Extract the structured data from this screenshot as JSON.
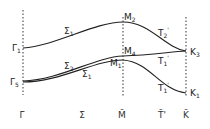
{
  "diagram": {
    "type": "band-structure",
    "axis_points": [
      {
        "label": "Γ̄",
        "x": 22
      },
      {
        "label": "Σ̄",
        "x": 82
      },
      {
        "label": "M̄",
        "x": 122
      },
      {
        "label": "T̄'",
        "x": 162
      },
      {
        "label": "K̄",
        "x": 186
      }
    ],
    "point_labels": [
      {
        "base": "Γ",
        "sub": "1",
        "x": 12,
        "y": 51
      },
      {
        "base": "Γ",
        "sub": "5",
        "x": 10,
        "y": 85
      },
      {
        "base": "M",
        "sub": "2",
        "x": 124,
        "y": 20
      },
      {
        "base": "M",
        "sub": "4",
        "x": 124,
        "y": 54
      },
      {
        "base": "M",
        "sub": "1",
        "x": 110,
        "y": 66
      },
      {
        "base": "K",
        "sub": "3",
        "x": 190,
        "y": 55
      },
      {
        "base": "K",
        "sub": "1",
        "x": 190,
        "y": 96
      }
    ],
    "branch_labels": [
      {
        "base": "Σ",
        "sub": "1",
        "x": 64,
        "y": 34
      },
      {
        "base": "Σ",
        "sub": "2",
        "x": 64,
        "y": 69
      },
      {
        "base": "Σ",
        "sub": "1",
        "x": 82,
        "y": 77
      },
      {
        "base": "T",
        "sub": "2",
        "prime": "'",
        "x": 158,
        "y": 36
      },
      {
        "base": "T",
        "sub": "1",
        "prime": "'",
        "x": 158,
        "y": 64
      },
      {
        "base": "T",
        "sub": "1",
        "prime": "'",
        "x": 158,
        "y": 91
      }
    ]
  }
}
